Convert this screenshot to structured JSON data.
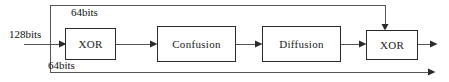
{
  "diagram": {
    "canvas": {
      "width": 449,
      "height": 82,
      "background": "#ffffff"
    },
    "colors": {
      "stroke": "#2b2b2b",
      "line": "#555555",
      "text": "#111111",
      "box_fill": "#ffffff"
    },
    "nodes": [
      {
        "id": "xor1",
        "label": "XOR"
      },
      {
        "id": "confusion",
        "label": "Confusion"
      },
      {
        "id": "diffusion",
        "label": "Diffusion"
      },
      {
        "id": "xor2",
        "label": "XOR"
      }
    ],
    "labels": {
      "input_width": "128bits",
      "top_branch_width": "64bits",
      "bottom_branch_width": "64bits"
    },
    "edges": [
      {
        "id": "input-to-split",
        "from": "input",
        "to": "split-point",
        "label": "128bits"
      },
      {
        "id": "split-to-xor1",
        "from": "split-point",
        "to": "xor1",
        "label": ""
      },
      {
        "id": "top-feedback",
        "from": "split-point",
        "to": "xor2",
        "label": "64bits"
      },
      {
        "id": "xor1-to-confusion",
        "from": "xor1",
        "to": "confusion",
        "label": ""
      },
      {
        "id": "confusion-to-diffusion",
        "from": "confusion",
        "to": "diffusion",
        "label": ""
      },
      {
        "id": "diffusion-to-xor2",
        "from": "diffusion",
        "to": "xor2",
        "label": ""
      },
      {
        "id": "xor2-to-output",
        "from": "xor2",
        "to": "output",
        "label": ""
      },
      {
        "id": "bottom-bypass",
        "from": "split-point",
        "to": "output",
        "label": "64bits"
      }
    ]
  }
}
